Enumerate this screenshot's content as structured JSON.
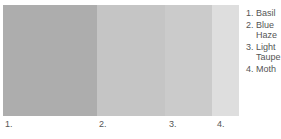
{
  "chart_data": {
    "type": "bar",
    "title": "",
    "xlabel": "",
    "ylabel": "",
    "categories": [
      "1.",
      "2.",
      "3.",
      "4."
    ],
    "values": [
      94,
      68,
      47,
      27
    ],
    "series": [
      {
        "name": "Basil",
        "index": "1.",
        "color": "#adadad",
        "width_px": 94
      },
      {
        "name": "Blue Haze",
        "index": "2.",
        "color": "#c5c5c5",
        "width_px": 68
      },
      {
        "name": "Light Taupe",
        "index": "3.",
        "color": "#cbcbcb",
        "width_px": 47
      },
      {
        "name": "Moth",
        "index": "4.",
        "color": "#dedede",
        "width_px": 27
      }
    ],
    "legend_position": "right",
    "grid": false
  },
  "palette": {
    "swatches": [
      {
        "label": "1.",
        "name": "Basil",
        "color": "#adadad",
        "width": 94,
        "label_x": 5
      },
      {
        "label": "2.",
        "name": "Blue Haze",
        "color": "#c5c5c5",
        "width": 68,
        "label_x": 99
      },
      {
        "label": "3.",
        "name": "Light Taupe",
        "color": "#cbcbcb",
        "width": 47,
        "label_x": 169
      },
      {
        "label": "4.",
        "name": "Moth",
        "color": "#dedede",
        "width": 27,
        "label_x": 217
      }
    ]
  },
  "legend": {
    "items": [
      {
        "num": "1.",
        "name": "Basil"
      },
      {
        "num": "2.",
        "name": "Blue Haze"
      },
      {
        "num": "3.",
        "name": "Light Taupe"
      },
      {
        "num": "4.",
        "name": "Moth"
      }
    ]
  }
}
